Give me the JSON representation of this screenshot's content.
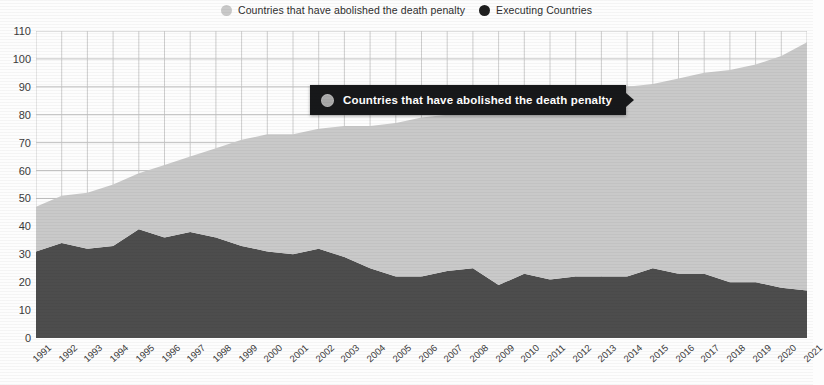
{
  "legend": {
    "items": [
      {
        "label": "Countries that have abolished the death penalty",
        "color": "#c9c9c9",
        "marker": "circle-marker"
      },
      {
        "label": "Executing Countries",
        "color": "#1f1f1f",
        "marker": "circle-marker"
      }
    ]
  },
  "tooltip": {
    "label": "Countries that have abolished the death penalty",
    "dot_color": "#a9a9a9",
    "background": "#17181a",
    "text_color": "#ffffff"
  },
  "chart_data": {
    "type": "area",
    "stacked": true,
    "title": "",
    "subtitle": "",
    "xlabel": "",
    "ylabel": "",
    "ylim": [
      0,
      110
    ],
    "ytick_step": 10,
    "ytick_labels": [
      "0",
      "10",
      "20",
      "30",
      "40",
      "50",
      "60",
      "70",
      "80",
      "90",
      "100",
      "110"
    ],
    "grid": true,
    "legend_position": "top-center",
    "categories": [
      "1991",
      "1992",
      "1993",
      "1994",
      "1995",
      "1996",
      "1997",
      "1998",
      "1999",
      "2000",
      "2001",
      "2002",
      "2003",
      "2004",
      "2005",
      "2006",
      "2007",
      "2008",
      "2009",
      "2010",
      "2011",
      "2012",
      "2013",
      "2014",
      "2015",
      "2016",
      "2017",
      "2018",
      "2019",
      "2020",
      "2021"
    ],
    "series": [
      {
        "name": "Executing Countries",
        "color": "#4d4d4d",
        "values": [
          31,
          34,
          32,
          33,
          39,
          36,
          38,
          36,
          33,
          31,
          30,
          32,
          29,
          25,
          22,
          22,
          24,
          25,
          19,
          23,
          21,
          22,
          22,
          22,
          25,
          23,
          23,
          20,
          20,
          18,
          17
        ]
      },
      {
        "name": "Countries that have abolished the death penalty",
        "color": "#c9c9c9",
        "values": [
          16,
          17,
          20,
          22,
          20,
          26,
          27,
          32,
          38,
          42,
          43,
          43,
          47,
          51,
          55,
          57,
          56,
          57,
          64,
          61,
          64,
          65,
          67,
          68,
          66,
          70,
          72,
          76,
          78,
          83,
          89
        ]
      }
    ],
    "totals": [
      47,
      51,
      52,
      55,
      59,
      62,
      65,
      68,
      71,
      73,
      73,
      75,
      76,
      76,
      77,
      79,
      80,
      82,
      83,
      84,
      85,
      87,
      89,
      90,
      91,
      93,
      95,
      96,
      98,
      101,
      106
    ]
  },
  "axes": {
    "y_min": 0,
    "y_max": 110,
    "x_first": "1991",
    "x_last": "2021"
  }
}
